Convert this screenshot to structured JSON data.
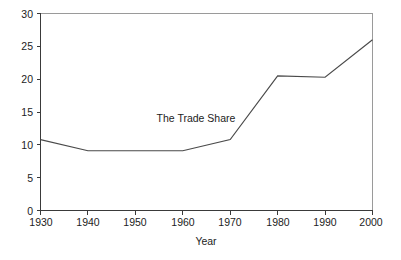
{
  "chart_data": {
    "type": "line",
    "title": "",
    "xlabel": "Year",
    "ylabel": "",
    "annotation": "The Trade Share",
    "legend": "none",
    "grid": false,
    "x": [
      1930,
      1940,
      1950,
      1960,
      1970,
      1980,
      1990,
      2000
    ],
    "categories": [
      "1930",
      "1940",
      "1950",
      "1960",
      "1970",
      "1980",
      "1990",
      "2000"
    ],
    "series": [
      {
        "name": "The Trade Share",
        "values": [
          10.8,
          9.1,
          9.1,
          9.1,
          10.8,
          20.5,
          20.3,
          26.0
        ]
      }
    ],
    "xlim": [
      1930,
      2000
    ],
    "ylim": [
      0,
      30
    ],
    "xticks": [
      "1930",
      "1940",
      "1950",
      "1960",
      "1970",
      "1980",
      "1990",
      "2000"
    ],
    "yticks": [
      "0",
      "5",
      "10",
      "15",
      "20",
      "25",
      "30"
    ],
    "line_color": "#4a4a4a",
    "axis_color": "#3a3a3a",
    "frame_color": "#9a9a9a",
    "background_color": "#ffffff"
  },
  "axes": {
    "y_tick_labels": [
      "30",
      "25",
      "20",
      "15",
      "10",
      "5",
      "0"
    ],
    "x_tick_labels": [
      "1930",
      "1940",
      "1950",
      "1960",
      "1970",
      "1980",
      "1990",
      "2000"
    ],
    "x_axis_title": "Year"
  },
  "annotations": {
    "series_label": "The Trade Share"
  }
}
